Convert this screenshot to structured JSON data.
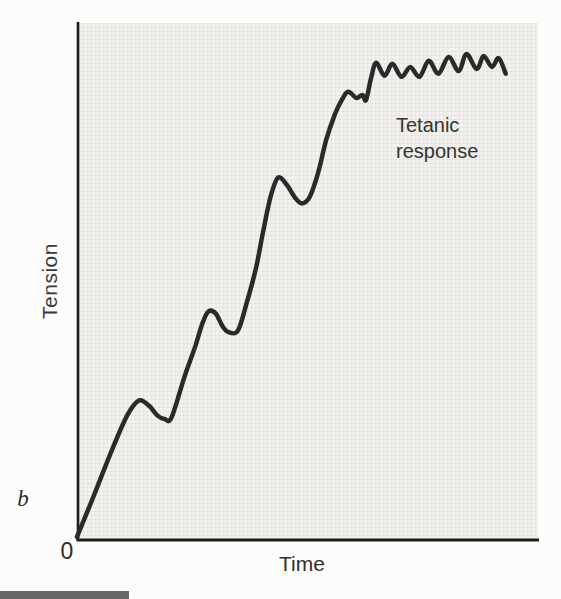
{
  "figure": {
    "panel_label": "b",
    "caption_bar_color": "#686868",
    "page_bg": "#fcfcfb"
  },
  "chart_data": {
    "type": "line",
    "title": "",
    "xlabel": "Time",
    "ylabel": "Tension",
    "origin_label": "0",
    "annotation": {
      "line1": "Tetanic",
      "line2": "response"
    },
    "xlim": [
      0,
      100
    ],
    "ylim": [
      0,
      100
    ],
    "grid": false,
    "legend": "none",
    "axis_color": "#1c1c1c",
    "curve_color": "#2a2a2a",
    "plot_bg": "#eeede9",
    "series": [
      {
        "name": "Muscle tension (summation to tetanus)",
        "points": [
          [
            0,
            0.6
          ],
          [
            3.7,
            8.7
          ],
          [
            7.4,
            17.0
          ],
          [
            10.9,
            24.1
          ],
          [
            13.5,
            27.0
          ],
          [
            15.7,
            25.9
          ],
          [
            17.4,
            24.1
          ],
          [
            19.0,
            23.4
          ],
          [
            20.5,
            23.7
          ],
          [
            23.3,
            31.5
          ],
          [
            25.7,
            37.6
          ],
          [
            27.2,
            41.9
          ],
          [
            28.5,
            44.2
          ],
          [
            30.1,
            43.8
          ],
          [
            31.6,
            41.3
          ],
          [
            32.9,
            40.2
          ],
          [
            34.9,
            40.5
          ],
          [
            36.8,
            45.8
          ],
          [
            38.8,
            52.5
          ],
          [
            40.3,
            59.3
          ],
          [
            42.0,
            66.4
          ],
          [
            43.6,
            70.1
          ],
          [
            45.5,
            68.7
          ],
          [
            47.3,
            66.2
          ],
          [
            48.8,
            65.1
          ],
          [
            50.5,
            66.4
          ],
          [
            52.3,
            71.0
          ],
          [
            54.0,
            77.2
          ],
          [
            55.8,
            82.0
          ],
          [
            57.3,
            84.9
          ],
          [
            58.8,
            86.7
          ],
          [
            60.6,
            85.5
          ],
          [
            61.9,
            86.1
          ],
          [
            62.7,
            85.1
          ],
          [
            63.8,
            89.4
          ],
          [
            64.9,
            92.3
          ],
          [
            66.7,
            89.8
          ],
          [
            68.4,
            92.1
          ],
          [
            70.4,
            89.6
          ],
          [
            72.3,
            91.5
          ],
          [
            74.3,
            89.6
          ],
          [
            76.3,
            92.7
          ],
          [
            78.4,
            90.2
          ],
          [
            80.6,
            93.4
          ],
          [
            82.8,
            90.7
          ],
          [
            84.5,
            94.0
          ],
          [
            86.7,
            91.1
          ],
          [
            88.2,
            93.6
          ],
          [
            90.0,
            91.5
          ],
          [
            91.5,
            93.2
          ],
          [
            93.0,
            90.2
          ]
        ]
      }
    ]
  }
}
